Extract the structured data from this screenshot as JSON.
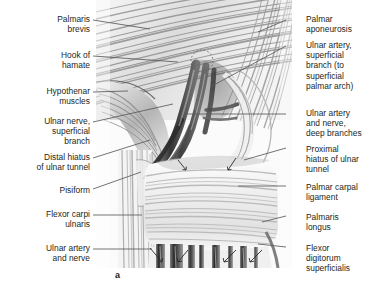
{
  "figure": {
    "panel_letter": "a",
    "panel_letter_pos": {
      "x": 115,
      "y": 270
    },
    "type": "anatomical-illustration",
    "style": "grayscale pencil/halftone medical illustration",
    "background": "#ffffff",
    "ink": "#231f20",
    "leader_color": "#5a5a5a"
  },
  "labels_left": [
    {
      "text": "Palmaris\nbrevis",
      "x": 6,
      "y": 14,
      "w": 84,
      "leader": {
        "x1": 93,
        "y1": 20,
        "x2": 150,
        "y2": 29
      }
    },
    {
      "text": "Hook of\nhamate",
      "x": 6,
      "y": 50,
      "w": 84,
      "leader": {
        "x1": 93,
        "y1": 56,
        "x2": 178,
        "y2": 62
      }
    },
    {
      "text": "Hypothenar\nmuscles",
      "x": 6,
      "y": 86,
      "w": 84,
      "leader": {
        "x1": 93,
        "y1": 92,
        "x2": 128,
        "y2": 91
      }
    },
    {
      "text": "Ulnar nerve,\nsuperficial\nbranch",
      "x": 6,
      "y": 116,
      "w": 84,
      "leader": {
        "x1": 93,
        "y1": 122,
        "x2": 173,
        "y2": 104
      }
    },
    {
      "text": "Distal hiatus\nof ulnar tunnel",
      "x": 6,
      "y": 152,
      "w": 84,
      "leader": {
        "x1": 93,
        "y1": 158,
        "x2": 150,
        "y2": 140
      }
    },
    {
      "text": "Pisiform",
      "x": 6,
      "y": 185,
      "w": 84,
      "leader": {
        "x1": 93,
        "y1": 189,
        "x2": 141,
        "y2": 172
      }
    },
    {
      "text": "Flexor carpi\nulnaris",
      "x": 6,
      "y": 209,
      "w": 84,
      "leader": {
        "x1": 93,
        "y1": 215,
        "x2": 142,
        "y2": 215
      }
    },
    {
      "text": "Ulnar artery\nand nerve",
      "x": 6,
      "y": 243,
      "w": 84,
      "leader": {
        "x1": 93,
        "y1": 249,
        "x2": 152,
        "y2": 249
      }
    }
  ],
  "labels_right": [
    {
      "text": "Palmar\naponeurosis",
      "x": 306,
      "y": 14,
      "w": 72,
      "leader": {
        "x1": 286,
        "y1": 20,
        "x2": 258,
        "y2": 32
      }
    },
    {
      "text": "Ulnar artery,\nsuperficial\nbranch (to\nsuperficial\npalmar arch)",
      "x": 306,
      "y": 40,
      "w": 72,
      "leader": {
        "x1": 286,
        "y1": 46,
        "x2": 212,
        "y2": 86
      }
    },
    {
      "text": "Ulnar artery\nand nerve,\ndeep branches",
      "x": 306,
      "y": 108,
      "w": 72,
      "leader": {
        "x1": 286,
        "y1": 114,
        "x2": 186,
        "y2": 114
      }
    },
    {
      "text": "Proximal\nhiatus of ulnar\ntunnel",
      "x": 306,
      "y": 144,
      "w": 72,
      "leader": {
        "x1": 286,
        "y1": 148,
        "x2": 244,
        "y2": 160
      }
    },
    {
      "text": "Palmar carpal\nligament",
      "x": 306,
      "y": 182,
      "w": 72,
      "leader": {
        "x1": 286,
        "y1": 186,
        "x2": 238,
        "y2": 186
      }
    },
    {
      "text": "Palmaris\nlongus",
      "x": 306,
      "y": 212,
      "w": 72,
      "leader": {
        "x1": 286,
        "y1": 216,
        "x2": 262,
        "y2": 222
      }
    },
    {
      "text": "Flexor\ndigitorum\nsuperficialis",
      "x": 306,
      "y": 243,
      "w": 72,
      "leader": {
        "x1": 286,
        "y1": 247,
        "x2": 258,
        "y2": 244
      }
    }
  ]
}
